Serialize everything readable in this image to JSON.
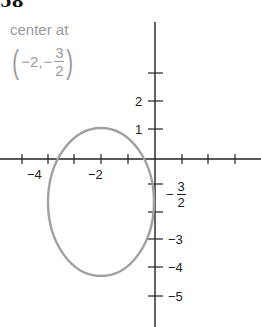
{
  "problem_number": "58",
  "annotation": {
    "line1": "center at",
    "open_paren": "(",
    "x": "−2,",
    "minus": "−",
    "frac_num": "3",
    "frac_den": "2",
    "close_paren": ")"
  },
  "x_tick_labels": [
    {
      "text": "−4",
      "value": -4
    },
    {
      "text": "−2",
      "value": -2
    }
  ],
  "y_tick_labels": [
    {
      "text": "2",
      "value": 2
    },
    {
      "text": "1",
      "value": 1
    },
    {
      "text": "−3",
      "value": -3
    },
    {
      "text": "−4",
      "value": -4
    },
    {
      "text": "−5",
      "value": -5
    }
  ],
  "y_frac_label": {
    "minus": "−",
    "num": "3",
    "den": "2",
    "value": -1.5
  },
  "ellipse": {
    "center": [
      -2,
      -1.5
    ],
    "semi_x": 2,
    "semi_y": 3,
    "color": "#a0a0a0"
  },
  "colors": {
    "axes": "#222222",
    "ellipse": "#a0a0a0",
    "annotation": "#9a9a9a"
  }
}
